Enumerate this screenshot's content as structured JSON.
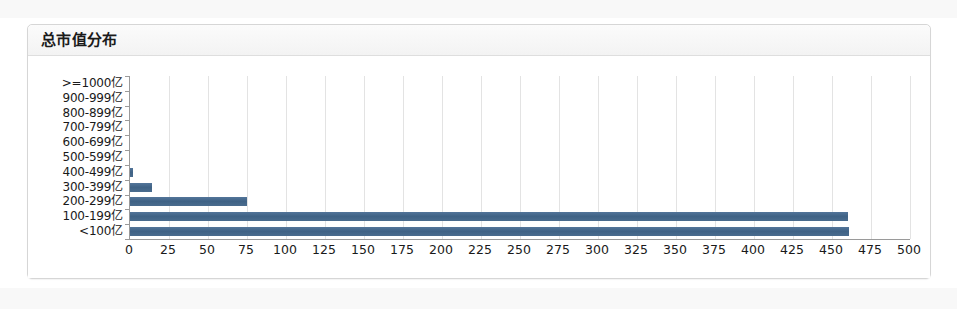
{
  "panel": {
    "title": "总市值分布"
  },
  "chart_data": {
    "type": "bar",
    "orientation": "horizontal",
    "title": "总市值分布",
    "xlabel": "",
    "ylabel": "",
    "grid": true,
    "legend": false,
    "xlim": [
      0,
      500
    ],
    "xtick_step": 25,
    "xticks": [
      "0",
      "25",
      "50",
      "75",
      "100",
      "125",
      "150",
      "175",
      "200",
      "225",
      "250",
      "275",
      "300",
      "325",
      "350",
      "375",
      "400",
      "425",
      "450",
      "475",
      "500"
    ],
    "categories": [
      ">=1000亿",
      "900-999亿",
      "800-899亿",
      "700-799亿",
      "600-699亿",
      "500-599亿",
      "400-499亿",
      "300-399亿",
      "200-299亿",
      "100-199亿",
      "<100亿"
    ],
    "values": [
      0,
      0,
      0,
      0,
      0,
      0,
      2,
      14,
      75,
      460,
      461
    ],
    "bar_color": "#46688a"
  },
  "colors": {
    "bar": "#46688a",
    "grid": "#e3e3e3",
    "axis": "#9a9a9a",
    "panel_border": "#d6d6d6",
    "header_bg": "#f3f3f3",
    "text": "#1a1a1a"
  }
}
